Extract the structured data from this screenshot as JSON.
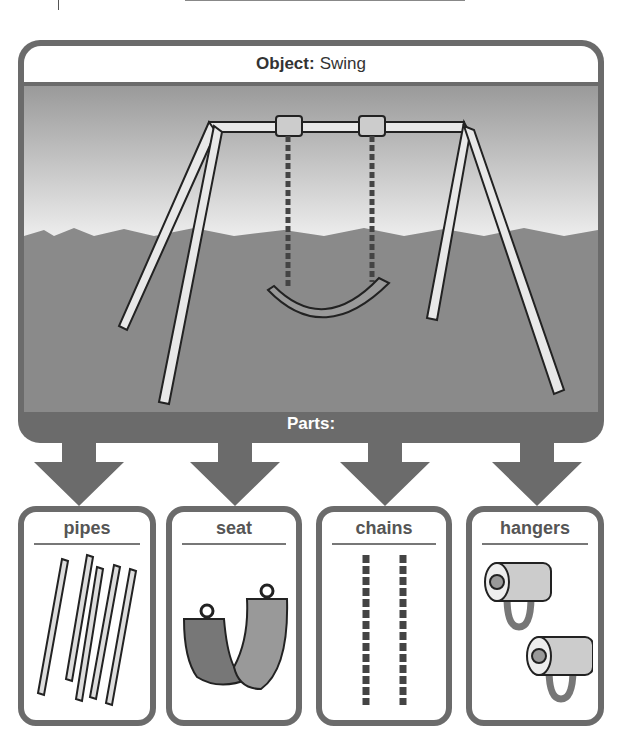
{
  "header": {
    "label": "Object:",
    "value": "Swing"
  },
  "parts_label": "Parts:",
  "parts": [
    {
      "name": "pipes"
    },
    {
      "name": "seat"
    },
    {
      "name": "chains"
    },
    {
      "name": "hangers"
    }
  ],
  "colors": {
    "frame": "#6b6b6b",
    "sky": "#e6e6e6",
    "grass": "#8a8a8a",
    "card_border": "#6b6b6b"
  }
}
